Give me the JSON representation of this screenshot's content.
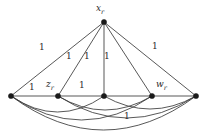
{
  "figure": {
    "type": "weighted-graph-diagram",
    "width": 204,
    "height": 133,
    "background": "#ffffff",
    "stroke_color": "#3a3a3a",
    "node_color": "#1a1a1a"
  },
  "nodes": [
    {
      "id": "apex",
      "label_base": "x",
      "label_sub": "r",
      "x": 104,
      "y": 22,
      "label_x": 96,
      "label_y": 4,
      "has_label": true
    },
    {
      "id": "n1",
      "label_base": "",
      "label_sub": "",
      "x": 11,
      "y": 96,
      "label_x": 0,
      "label_y": 0,
      "has_label": false
    },
    {
      "id": "n2",
      "label_base": "z",
      "label_sub": "r",
      "x": 58,
      "y": 96,
      "label_x": 46,
      "label_y": 80,
      "has_label": true
    },
    {
      "id": "n3",
      "label_base": "",
      "label_sub": "",
      "x": 104,
      "y": 96,
      "label_x": 0,
      "label_y": 0,
      "has_label": false
    },
    {
      "id": "n4",
      "label_base": "w",
      "label_sub": "r",
      "x": 152,
      "y": 96,
      "label_x": 156,
      "label_y": 80,
      "has_label": true
    },
    {
      "id": "n5",
      "label_base": "",
      "label_sub": "",
      "x": 196,
      "y": 96,
      "label_x": 0,
      "label_y": 0,
      "has_label": false
    }
  ],
  "straight_edges": [
    {
      "from": "apex",
      "to": "n1"
    },
    {
      "from": "apex",
      "to": "n2"
    },
    {
      "from": "apex",
      "to": "n3"
    },
    {
      "from": "apex",
      "to": "n4"
    },
    {
      "from": "apex",
      "to": "n5"
    },
    {
      "from": "n1",
      "to": "n2"
    },
    {
      "from": "n2",
      "to": "n3"
    },
    {
      "from": "n3",
      "to": "n4"
    },
    {
      "from": "n4",
      "to": "n5"
    }
  ],
  "curved_edges": [
    {
      "from": "n1",
      "to": "n3",
      "sag": 16
    },
    {
      "from": "n1",
      "to": "n4",
      "sag": 24
    },
    {
      "from": "n1",
      "to": "n5",
      "sag": 34
    },
    {
      "from": "n2",
      "to": "n4",
      "sag": 14
    },
    {
      "from": "n2",
      "to": "n5",
      "sag": 22
    },
    {
      "from": "n3",
      "to": "n5",
      "sag": 13
    }
  ],
  "edge_weight_labels": [
    {
      "text": "1",
      "x": 39,
      "y": 43
    },
    {
      "text": "1",
      "x": 66,
      "y": 52
    },
    {
      "text": "1",
      "x": 84,
      "y": 52
    },
    {
      "text": "1",
      "x": 104,
      "y": 52
    },
    {
      "text": "1",
      "x": 152,
      "y": 42
    },
    {
      "text": "1",
      "x": 29,
      "y": 83
    },
    {
      "text": "1",
      "x": 79,
      "y": 81
    },
    {
      "text": "1",
      "x": 124,
      "y": 112
    }
  ]
}
